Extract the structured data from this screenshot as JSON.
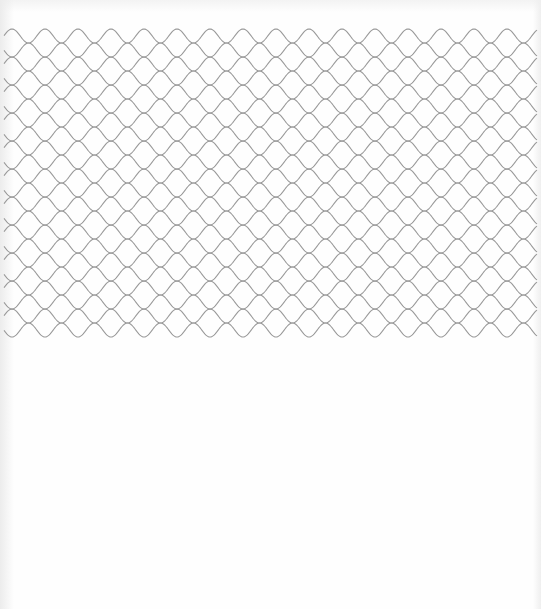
{
  "image": {
    "description": "Wavy ogee lattice line pattern on white paper",
    "background_color": "#fefefe",
    "line_color": "#9a9a9a"
  },
  "pattern": {
    "type": "interlocking-sine-waves",
    "wave_count": 22,
    "period_px": 33,
    "peak_to_peak_px": 14,
    "vertical_spacing_px": 14,
    "first_crest_y": 29,
    "first_crest_x": 12,
    "x_start": 4,
    "x_end": 537,
    "line_width": 1.1
  }
}
